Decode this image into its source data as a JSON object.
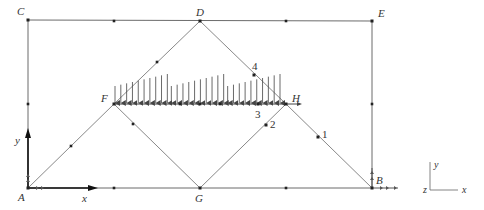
{
  "diagram": {
    "colors": {
      "member": "#7a7a7a",
      "frame": "#5a5a5a",
      "node": "#222222",
      "load": "#444444",
      "axis": "#111111",
      "label": "#333333"
    },
    "nodes": [
      {
        "id": "A",
        "label": "A",
        "x": 28,
        "y": 188,
        "lx": 18,
        "ly": 201
      },
      {
        "id": "B",
        "label": "B",
        "x": 372,
        "y": 188,
        "lx": 376,
        "ly": 184
      },
      {
        "id": "C",
        "label": "C",
        "x": 28,
        "y": 20,
        "lx": 17,
        "ly": 15
      },
      {
        "id": "D",
        "label": "D",
        "x": 200,
        "y": 21,
        "lx": 196,
        "ly": 16
      },
      {
        "id": "E",
        "label": "E",
        "x": 372,
        "y": 21,
        "lx": 378,
        "ly": 17
      },
      {
        "id": "F",
        "label": "F",
        "x": 114,
        "y": 104,
        "lx": 101,
        "ly": 102
      },
      {
        "id": "G",
        "label": "G",
        "x": 200,
        "y": 188,
        "lx": 195,
        "ly": 202
      },
      {
        "id": "H",
        "label": "H",
        "x": 286,
        "y": 104,
        "lx": 292,
        "ly": 102
      }
    ],
    "point_labels": [
      {
        "label": "1",
        "x": 318,
        "y": 137,
        "lx": 322,
        "ly": 138
      },
      {
        "label": "2",
        "x": 266,
        "y": 125,
        "lx": 270,
        "ly": 128
      },
      {
        "label": "3",
        "x": 258,
        "y": 104,
        "lx": 255,
        "ly": 118
      },
      {
        "label": "4",
        "x": 254,
        "y": 75,
        "lx": 252,
        "ly": 70
      }
    ],
    "members": [
      [
        "C",
        "E"
      ],
      [
        "C",
        "A"
      ],
      [
        "E",
        "B"
      ],
      [
        "A",
        "B"
      ],
      [
        "A",
        "F"
      ],
      [
        "F",
        "D"
      ],
      [
        "D",
        "H"
      ],
      [
        "H",
        "B"
      ],
      [
        "F",
        "G"
      ],
      [
        "G",
        "H"
      ],
      [
        "F",
        "H"
      ]
    ],
    "mid_nodes": [
      {
        "x": 114,
        "y": 21
      },
      {
        "x": 286,
        "y": 21
      },
      {
        "x": 28,
        "y": 104
      },
      {
        "x": 372,
        "y": 104
      },
      {
        "x": 114,
        "y": 188
      },
      {
        "x": 286,
        "y": 188
      },
      {
        "x": 71,
        "y": 146
      },
      {
        "x": 157,
        "y": 62
      },
      {
        "x": 133,
        "y": 124
      },
      {
        "x": 180,
        "y": 104
      },
      {
        "x": 220,
        "y": 104
      },
      {
        "x": 200,
        "y": 104
      }
    ],
    "load": {
      "type": "distributed",
      "direction": "down",
      "x_start": 114,
      "x_end": 283,
      "base_y": 104,
      "segments": 3,
      "arrows_per_segment": 10,
      "top_low_y": 86,
      "top_high_y": 74
    },
    "global_axes": {
      "x_label": "x",
      "y_label": "y",
      "origin_x": 28,
      "origin_y": 188,
      "x_end": 88,
      "y_end": 138,
      "x_label_pos": [
        82,
        202
      ],
      "y_label_pos": [
        15,
        144
      ]
    },
    "triad": {
      "x_label": "x",
      "y_label": "y",
      "z_label": "z",
      "origin_x": 430,
      "origin_y": 190,
      "x_len": 28,
      "y_len": 28
    },
    "supports": [
      {
        "node": "A",
        "type": "pinned"
      },
      {
        "node": "B",
        "type": "roller"
      }
    ]
  }
}
